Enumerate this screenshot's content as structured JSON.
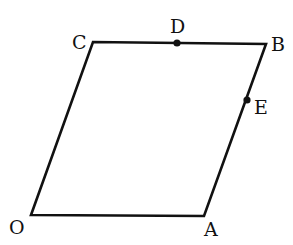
{
  "diagram": {
    "type": "parallelogram",
    "stroke_color": "#111111",
    "background": "#ffffff",
    "vertices": {
      "O": {
        "label": "O",
        "x": 31,
        "y": 215
      },
      "A": {
        "label": "A",
        "x": 204,
        "y": 216
      },
      "B": {
        "label": "B",
        "x": 266,
        "y": 44
      },
      "C": {
        "label": "C",
        "x": 93,
        "y": 42
      }
    },
    "points": {
      "D": {
        "label": "D",
        "x": 177,
        "y": 43,
        "on_segment": "CB"
      },
      "E": {
        "label": "E",
        "x": 247,
        "y": 100,
        "on_segment": "AB"
      }
    },
    "edges": [
      "OA",
      "AB",
      "BC",
      "CO"
    ]
  }
}
